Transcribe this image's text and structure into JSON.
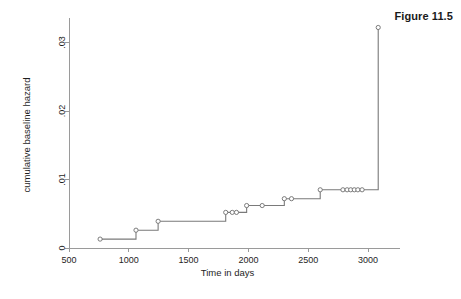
{
  "figure": {
    "label": "Figure 11.5"
  },
  "chart_data": {
    "type": "line",
    "subtype": "step",
    "title": "Figure 11.5",
    "xlabel": "Time in days",
    "ylabel": "cumulative baseline hazard",
    "xlim": [
      500,
      3150
    ],
    "ylim": [
      0,
      0.033
    ],
    "xticks": [
      500,
      1000,
      1500,
      2000,
      2500,
      3000
    ],
    "xticklabels": [
      "500",
      "1000",
      "1500",
      "2000",
      "2500",
      "3000"
    ],
    "yticks": [
      0,
      0.01,
      0.02,
      0.03
    ],
    "yticklabels": [
      "0",
      ".01",
      ".02",
      ".03"
    ],
    "grid": false,
    "legend": false,
    "marker": "open-circle",
    "line_color": "#7a7a7a",
    "marker_color": "#6e6e6e",
    "x": [
      760,
      1060,
      1245,
      1810,
      1865,
      1900,
      1985,
      2115,
      2300,
      2360,
      2600,
      2790,
      2825,
      2855,
      2885,
      2915,
      2950,
      3085
    ],
    "y": [
      0.0013,
      0.0026,
      0.0039,
      0.0052,
      0.0052,
      0.0052,
      0.0062,
      0.0062,
      0.0072,
      0.0072,
      0.0085,
      0.0085,
      0.0085,
      0.0085,
      0.0085,
      0.0085,
      0.0085,
      0.0322
    ]
  }
}
